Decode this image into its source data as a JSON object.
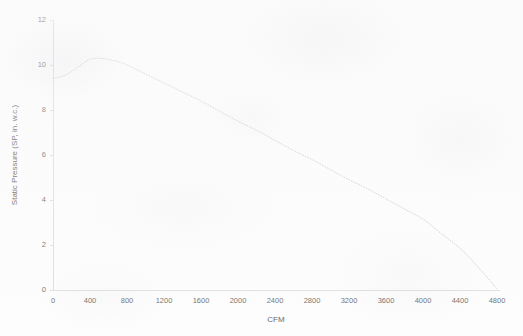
{
  "chart_data": {
    "type": "line",
    "title": "",
    "subtitle": "",
    "xlabel": "CFM",
    "ylabel": "Static Pressure (SP, in. w.c.)",
    "xlim": [
      0,
      4800
    ],
    "ylim": [
      0,
      12
    ],
    "xticks": [
      0,
      400,
      800,
      1200,
      1600,
      2000,
      2400,
      2800,
      3200,
      3600,
      4000,
      4400,
      4800
    ],
    "yticks": [
      0,
      2,
      4,
      6,
      8,
      10,
      12
    ],
    "xtick_labels": [
      "0",
      "400",
      "800",
      "1200",
      "1600",
      "2000",
      "2400",
      "2800",
      "3200",
      "3600",
      "4000",
      "4400",
      "4800"
    ],
    "ytick_labels": [
      "0",
      "2",
      "4",
      "6",
      "8",
      "10",
      "12"
    ],
    "grid": false,
    "legend": false,
    "legend_position": "none",
    "line_style": "dotted",
    "line_color": "#b9b9b9",
    "axis_color": "#d5d5d5",
    "text_color": "#3d3d3d",
    "background_color": "#fdfdfd",
    "series": [
      {
        "name": "Fan static pressure curve",
        "x": [
          0,
          100,
          200,
          300,
          400,
          500,
          600,
          700,
          800,
          1000,
          1200,
          1400,
          1600,
          1800,
          2000,
          2200,
          2400,
          2600,
          2800,
          3000,
          3200,
          3400,
          3600,
          3800,
          4000,
          4200,
          4400,
          4600,
          4800
        ],
        "values": [
          9.4,
          9.5,
          9.7,
          10.0,
          10.25,
          10.3,
          10.25,
          10.15,
          10.0,
          9.6,
          9.2,
          8.8,
          8.4,
          7.95,
          7.5,
          7.1,
          6.65,
          6.2,
          5.8,
          5.35,
          4.9,
          4.5,
          4.05,
          3.6,
          3.15,
          2.5,
          1.85,
          1.0,
          0.05
        ]
      }
    ]
  },
  "figure": {
    "plot_left_px": 53,
    "plot_right_px": 497,
    "plot_top_px": 20,
    "plot_bottom_px": 290
  }
}
